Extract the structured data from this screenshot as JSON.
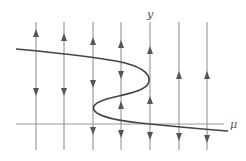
{
  "diagram": {
    "title": "",
    "type": "bifurcation-diagram",
    "axes": {
      "horizontal_label": "μ",
      "vertical_label": "y"
    },
    "colors": {
      "background": "#ffffff",
      "flow_line": "#8a8a8a",
      "curve": "#444444",
      "arrow": "#555555",
      "axis": "#999999"
    },
    "flow_lines": [
      {
        "x": 36,
        "arrows": [
          {
            "y": 33,
            "dir": "up"
          },
          {
            "y": 92,
            "dir": "down"
          }
        ]
      },
      {
        "x": 64,
        "arrows": [
          {
            "y": 37,
            "dir": "up"
          },
          {
            "y": 92,
            "dir": "down"
          }
        ]
      },
      {
        "x": 93,
        "arrows": [
          {
            "y": 41,
            "dir": "up"
          },
          {
            "y": 84,
            "dir": "down"
          },
          {
            "y": 131,
            "dir": "down"
          }
        ]
      },
      {
        "x": 121,
        "arrows": [
          {
            "y": 44,
            "dir": "up"
          },
          {
            "y": 75,
            "dir": "down"
          },
          {
            "y": 105,
            "dir": "up"
          },
          {
            "y": 134,
            "dir": "down"
          }
        ]
      },
      {
        "x": 150,
        "arrows": [
          {
            "y": 50,
            "dir": "up"
          },
          {
            "y": 100,
            "dir": "up"
          },
          {
            "y": 136,
            "dir": "down"
          }
        ]
      },
      {
        "x": 179,
        "arrows": [
          {
            "y": 75,
            "dir": "up"
          },
          {
            "y": 137,
            "dir": "down"
          }
        ]
      },
      {
        "x": 207,
        "arrows": [
          {
            "y": 75,
            "dir": "up"
          },
          {
            "y": 139,
            "dir": "down"
          }
        ]
      }
    ],
    "equilibrium_curve": "S-shaped curve with two fold points (saddle-node bifurcations)"
  }
}
